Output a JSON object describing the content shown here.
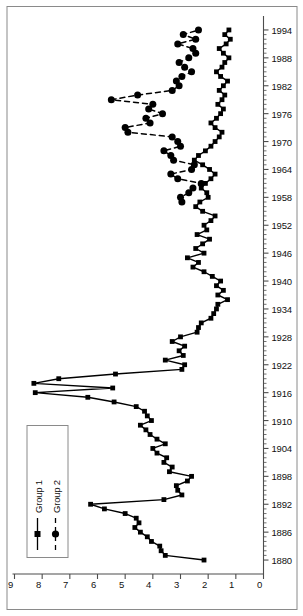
{
  "chart_data": {
    "type": "line",
    "title": "",
    "subtitle": "",
    "xlabel": "",
    "ylabel": "",
    "orientation": "rotated-90-ccw",
    "grid": false,
    "frame": true,
    "legend_position": "top-left",
    "xlim": [
      1877,
      1997
    ],
    "ylim": [
      0,
      9
    ],
    "x_tick_labels": [
      "1880",
      "1886",
      "1892",
      "1898",
      "1904",
      "1910",
      "1916",
      "1922",
      "1928",
      "1934",
      "1940",
      "1946",
      "1952",
      "1958",
      "1964",
      "1970",
      "1976",
      "1982",
      "1988",
      "1994"
    ],
    "x_tick_values": [
      1880,
      1886,
      1892,
      1898,
      1904,
      1910,
      1916,
      1922,
      1928,
      1934,
      1940,
      1946,
      1952,
      1958,
      1964,
      1970,
      1976,
      1982,
      1988,
      1994
    ],
    "x_minor_tick_step": 1,
    "y_tick_labels": [
      "0",
      "1",
      "2",
      "3",
      "4",
      "5",
      "6",
      "7",
      "8",
      "9"
    ],
    "y_tick_values": [
      0,
      1,
      2,
      3,
      4,
      5,
      6,
      7,
      8,
      9
    ],
    "series": [
      {
        "name": "Group 1",
        "marker": "square",
        "line_style": "solid",
        "color": "#000000",
        "x": [
          1880,
          1881,
          1882,
          1883,
          1884,
          1885,
          1886,
          1887,
          1888,
          1889,
          1890,
          1891,
          1892,
          1893,
          1894,
          1895,
          1896,
          1897,
          1898,
          1899,
          1900,
          1901,
          1902,
          1903,
          1904,
          1905,
          1906,
          1907,
          1908,
          1909,
          1910,
          1911,
          1912,
          1913,
          1914,
          1915,
          1916,
          1917,
          1918,
          1919,
          1920,
          1921,
          1922,
          1923,
          1924,
          1925,
          1926,
          1927,
          1928,
          1929,
          1930,
          1931,
          1932,
          1933,
          1934,
          1935,
          1936,
          1937,
          1938,
          1939,
          1940,
          1941,
          1942,
          1943,
          1944,
          1945,
          1946,
          1947,
          1948,
          1949,
          1950,
          1951,
          1952,
          1953,
          1954,
          1955,
          1956,
          1957,
          1958,
          1959,
          1960,
          1961,
          1962,
          1963,
          1964,
          1965,
          1966,
          1967,
          1968,
          1969,
          1970,
          1971,
          1972,
          1973,
          1974,
          1975,
          1976,
          1977,
          1978,
          1979,
          1980,
          1981,
          1982,
          1983,
          1984,
          1985,
          1986,
          1987,
          1988,
          1989,
          1990,
          1991,
          1992,
          1993,
          1994
        ],
        "y": [
          2.15,
          3.55,
          3.7,
          3.75,
          4.05,
          4.2,
          4.45,
          4.65,
          4.5,
          4.6,
          5.0,
          5.75,
          6.25,
          3.6,
          2.95,
          3.1,
          3.15,
          2.75,
          2.6,
          3.4,
          3.3,
          3.6,
          3.5,
          3.85,
          4.0,
          3.55,
          3.85,
          4.1,
          4.25,
          4.45,
          4.05,
          4.2,
          4.3,
          4.6,
          5.4,
          6.35,
          8.25,
          5.45,
          8.3,
          7.4,
          5.35,
          2.95,
          2.85,
          3.55,
          2.9,
          3.05,
          2.85,
          3.3,
          3.0,
          2.4,
          2.35,
          2.25,
          1.9,
          1.8,
          1.7,
          1.65,
          1.3,
          1.65,
          1.45,
          1.7,
          1.55,
          1.85,
          2.15,
          2.55,
          2.35,
          2.75,
          2.15,
          2.45,
          2.2,
          1.95,
          2.4,
          2.05,
          2.15,
          1.9,
          1.75,
          2.2,
          2.45,
          2.3,
          2.0,
          2.05,
          2.25,
          2.1,
          1.9,
          1.75,
          1.95,
          2.2,
          2.5,
          2.35,
          2.1,
          1.9,
          1.75,
          1.6,
          1.5,
          1.75,
          1.9,
          1.7,
          1.55,
          1.45,
          1.65,
          1.5,
          1.4,
          1.6,
          1.45,
          1.3,
          1.55,
          1.7,
          1.5,
          1.4,
          1.25,
          1.45,
          1.6,
          1.35,
          1.2,
          1.4,
          1.25
        ]
      },
      {
        "name": "Group 2",
        "marker": "circle",
        "line_style": "dashed",
        "color": "#000000",
        "x": [
          1957,
          1958,
          1959,
          1960,
          1961,
          1962,
          1963,
          1964,
          1965,
          1966,
          1967,
          1968,
          1969,
          1970,
          1971,
          1972,
          1973,
          1974,
          1975,
          1976,
          1977,
          1978,
          1979,
          1980,
          1981,
          1982,
          1983,
          1984,
          1985,
          1986,
          1987,
          1988,
          1989,
          1990,
          1991,
          1992,
          1993,
          1994
        ],
        "y": [
          2.95,
          3.0,
          2.7,
          2.55,
          2.25,
          3.1,
          3.35,
          2.6,
          2.5,
          3.25,
          3.35,
          3.6,
          3.0,
          3.1,
          3.3,
          4.9,
          5.0,
          4.1,
          4.25,
          3.65,
          4.15,
          4.0,
          5.5,
          4.55,
          3.3,
          3.05,
          3.15,
          2.95,
          2.6,
          2.85,
          3.05,
          2.7,
          2.45,
          2.55,
          3.1,
          2.45,
          2.9,
          2.35
        ]
      }
    ]
  },
  "legend": {
    "items": [
      {
        "label": "Group 1",
        "marker": "square",
        "line_style": "solid"
      },
      {
        "label": "Group 2",
        "marker": "circle",
        "line_style": "dashed"
      }
    ]
  },
  "colors": {
    "line": "#000000",
    "frame": "#8a8a8a",
    "axis": "#4d4d4d",
    "text": "#111111",
    "background": "#ffffff"
  }
}
